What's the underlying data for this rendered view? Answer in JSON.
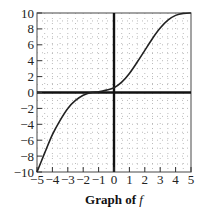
{
  "chart_data": {
    "type": "line",
    "title": "Graph of f",
    "title_parts": {
      "bold": "Graph of",
      "italic": "f"
    },
    "xlabel": "",
    "ylabel": "",
    "xlim": [
      -5,
      5
    ],
    "ylim": [
      -10,
      10
    ],
    "x_ticks": [
      "-5",
      "-4",
      "-3",
      "-2",
      "-1",
      "0",
      "1",
      "2",
      "3",
      "4",
      "5"
    ],
    "y_ticks": [
      "10",
      "8",
      "6",
      "4",
      "2",
      "0",
      "-2",
      "-4",
      "-6",
      "-8",
      "-10"
    ],
    "grid": "dotted",
    "series": [
      {
        "name": "f",
        "x": [
          -5,
          -4.5,
          -4,
          -3.5,
          -3,
          -2.5,
          -2,
          -1.5,
          -1,
          -0.5,
          0,
          0.5,
          1,
          1.5,
          2,
          2.5,
          3,
          3.5,
          4,
          4.5,
          5
        ],
        "y": [
          -10,
          -7.6,
          -5.3,
          -3.5,
          -2.0,
          -1.0,
          -0.35,
          0,
          0.1,
          0.3,
          0.6,
          1.3,
          2.4,
          3.8,
          5.3,
          6.8,
          8.1,
          9.1,
          9.7,
          9.95,
          10
        ]
      }
    ],
    "colors": {
      "curve": "#222222",
      "axes": "#111111",
      "frame": "#666666",
      "grid": "#aaaaaa"
    }
  }
}
